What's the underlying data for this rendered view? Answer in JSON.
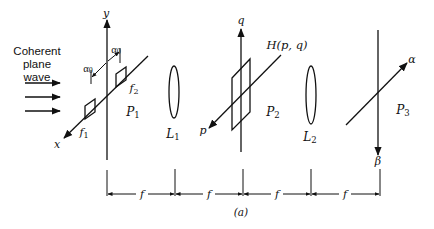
{
  "figure": {
    "label": "(a)",
    "source_label": [
      "Coherent",
      "plane",
      "wave"
    ]
  },
  "plane_p1": {
    "name": "P",
    "sub": "1",
    "vertical_axis": "y",
    "diagonal_axis": "x",
    "spacing_label_left": "α",
    "spacing_label_left_sub": "0",
    "spacing_label_right": "α",
    "spacing_label_right_sub": "0",
    "aperture_1": {
      "name": "f",
      "sub": "1"
    },
    "aperture_2": {
      "name": "f",
      "sub": "2"
    }
  },
  "lens_1": {
    "name": "L",
    "sub": "1"
  },
  "plane_p2": {
    "name": "P",
    "sub": "2",
    "vertical_axis": "q",
    "diagonal_axis": "p",
    "filter_label": "H(p, q)"
  },
  "lens_2": {
    "name": "L",
    "sub": "2"
  },
  "plane_p3": {
    "name": "P",
    "sub": "3",
    "vertical_axis": "β",
    "diagonal_axis": "α"
  },
  "dimensions": {
    "segments": [
      "f",
      "f",
      "f",
      "f"
    ]
  },
  "icons": {
    "arrow": "arrow-right-icon",
    "lens": "biconvex-lens-icon"
  }
}
